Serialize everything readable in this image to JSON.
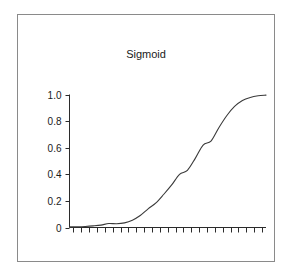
{
  "figure": {
    "title": "Sigmoid",
    "background_color": "#ffffff",
    "frame_color": "#8a8a8a",
    "axis_color": "#2b2b2b",
    "curve_color": "#3a3a3a"
  },
  "chart_data": {
    "type": "line",
    "title": "Sigmoid",
    "xlabel": "",
    "ylabel": "",
    "grid": false,
    "legend": null,
    "xlim": [
      0,
      25
    ],
    "ylim": [
      0,
      1.0
    ],
    "y_tick_labels": [
      "1.0",
      "0.8",
      "0.6",
      "0.4",
      "0.2",
      "0"
    ],
    "y_tick_values": [
      1.0,
      0.8,
      0.6,
      0.4,
      0.2,
      0
    ],
    "x_tick_labels": [],
    "x_tick_count": 25,
    "series": [
      {
        "name": "sigmoid",
        "x": [
          0,
          1,
          2,
          3,
          4,
          5,
          6,
          7,
          8,
          9,
          10,
          11,
          12,
          13,
          14,
          15,
          16,
          17,
          18,
          19,
          20,
          21,
          22,
          23,
          24,
          25
        ],
        "values": [
          0.005,
          0.006,
          0.008,
          0.012,
          0.018,
          0.03,
          0.028,
          0.035,
          0.055,
          0.09,
          0.14,
          0.185,
          0.25,
          0.32,
          0.4,
          0.43,
          0.52,
          0.62,
          0.65,
          0.75,
          0.84,
          0.91,
          0.955,
          0.978,
          0.99,
          0.995
        ]
      }
    ]
  }
}
